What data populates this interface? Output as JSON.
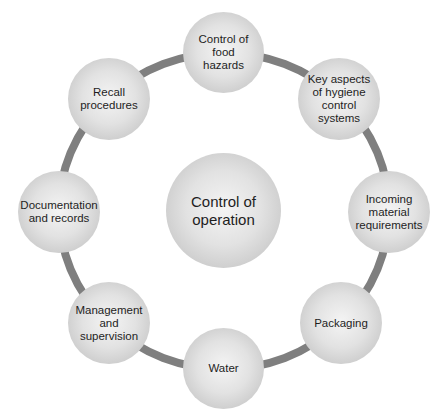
{
  "diagram": {
    "type": "cycle",
    "ring_color": "#7f7f7f",
    "center": {
      "label": "Control of operation",
      "lines": [
        "Control of",
        "operation"
      ]
    },
    "nodes": [
      {
        "id": "control-of-food-hazards",
        "lines": [
          "Control of food",
          "hazards"
        ]
      },
      {
        "id": "key-aspects-hygiene",
        "lines": [
          "Key aspects",
          "of hygiene",
          "control",
          "systems"
        ]
      },
      {
        "id": "incoming-material",
        "lines": [
          "Incoming",
          "material",
          "requirements"
        ]
      },
      {
        "id": "packaging",
        "lines": [
          "Packaging"
        ]
      },
      {
        "id": "water",
        "lines": [
          "Water"
        ]
      },
      {
        "id": "management-supervision",
        "lines": [
          "Management",
          "and",
          "supervision"
        ]
      },
      {
        "id": "documentation-records",
        "lines": [
          "Documentation",
          "and records"
        ]
      },
      {
        "id": "recall-procedures",
        "lines": [
          "Recall",
          "procedures"
        ]
      }
    ]
  }
}
